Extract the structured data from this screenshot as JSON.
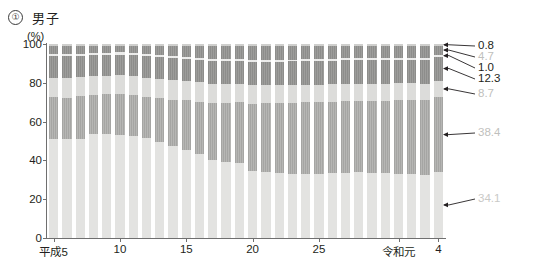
{
  "header": {
    "index_label": "①",
    "title": "男子"
  },
  "chart_data": {
    "type": "bar",
    "subtype": "stacked-100-percent",
    "title": "男子",
    "xlabel": "",
    "ylabel": "(%)",
    "ylim": [
      0,
      100
    ],
    "yticks": [
      0,
      20,
      40,
      60,
      80,
      100
    ],
    "grid": false,
    "legend_position": "none",
    "axis_unit": "(%)",
    "x_tick_labels": [
      "平成5",
      "10",
      "15",
      "20",
      "25",
      "令和元",
      "4"
    ],
    "x_tick_indices": [
      0,
      5,
      10,
      15,
      20,
      26,
      29
    ],
    "categories": [
      "平成5",
      "平成6",
      "平成7",
      "平成8",
      "平成9",
      "平成10",
      "平成11",
      "平成12",
      "平成13",
      "平成14",
      "平成15",
      "平成16",
      "平成17",
      "平成18",
      "平成19",
      "平成20",
      "平成21",
      "平成22",
      "平成23",
      "平成24",
      "平成25",
      "平成26",
      "平成27",
      "平成28",
      "平成29",
      "平成30",
      "令和元",
      "令和2",
      "令和3",
      "令和4"
    ],
    "series": [
      {
        "name": "segment-1",
        "color": "#e3e3e1",
        "final_value": 34.1,
        "values": [
          50.9,
          51.0,
          51.2,
          53.6,
          53.6,
          53.3,
          52.8,
          51.3,
          49.5,
          47.3,
          45.6,
          43.2,
          40.1,
          39.4,
          38.6,
          34.5,
          34.0,
          33.5,
          33.1,
          33.0,
          33.2,
          33.4,
          33.7,
          34.0,
          33.6,
          33.3,
          33.0,
          32.8,
          32.6,
          34.1
        ]
      },
      {
        "name": "segment-2",
        "color": "#a5a5a3",
        "final_value": 38.4,
        "values": [
          21.6,
          21.4,
          21.8,
          20.1,
          20.4,
          20.8,
          20.8,
          21.5,
          22.6,
          24.0,
          25.3,
          27.1,
          29.6,
          30.2,
          31.4,
          34.8,
          35.4,
          36.1,
          36.6,
          36.9,
          36.8,
          36.8,
          36.7,
          36.5,
          37.0,
          37.5,
          37.9,
          38.1,
          38.3,
          38.4
        ]
      },
      {
        "name": "segment-3",
        "color": "#dcdcda",
        "final_value": 8.7,
        "values": [
          10.0,
          10.1,
          9.9,
          9.8,
          9.7,
          9.7,
          9.8,
          9.9,
          10.0,
          10.0,
          10.0,
          9.9,
          9.8,
          9.7,
          9.6,
          9.4,
          9.3,
          9.2,
          9.2,
          9.1,
          9.1,
          9.0,
          9.0,
          8.9,
          8.9,
          8.8,
          8.8,
          8.8,
          8.7,
          8.7
        ]
      },
      {
        "name": "segment-4",
        "color": "#8d8d8b",
        "final_value": 12.3,
        "values": [
          11.1,
          11.2,
          11.0,
          10.9,
          10.8,
          10.8,
          10.9,
          11.0,
          11.2,
          11.3,
          11.4,
          11.5,
          11.7,
          11.8,
          11.9,
          12.0,
          12.1,
          12.1,
          12.1,
          12.1,
          12.1,
          12.2,
          12.2,
          12.2,
          12.2,
          12.3,
          12.3,
          12.3,
          12.3,
          12.3
        ]
      },
      {
        "name": "segment-5",
        "color": "#ececeb",
        "final_value": 1.0,
        "values": [
          1.2,
          1.2,
          1.1,
          1.1,
          1.1,
          1.1,
          1.1,
          1.1,
          1.1,
          1.1,
          1.1,
          1.1,
          1.1,
          1.0,
          1.0,
          1.0,
          1.0,
          1.0,
          1.0,
          1.0,
          1.0,
          1.0,
          1.0,
          1.0,
          1.0,
          1.0,
          1.0,
          1.0,
          1.0,
          1.0
        ]
      },
      {
        "name": "segment-6",
        "color": "#8d8d8b",
        "final_value": 4.7,
        "values": [
          4.3,
          4.2,
          4.1,
          3.6,
          3.5,
          3.4,
          3.7,
          4.2,
          4.6,
          5.3,
          5.6,
          6.1,
          6.6,
          6.8,
          6.4,
          7.2,
          7.1,
          7.0,
          7.0,
          6.9,
          6.8,
          6.6,
          6.4,
          6.4,
          6.3,
          6.1,
          5.9,
          5.9,
          5.9,
          4.7
        ]
      },
      {
        "name": "segment-7",
        "color": "#cfcfcd",
        "final_value": 0.8,
        "values": [
          0.9,
          0.9,
          0.9,
          0.9,
          0.9,
          0.9,
          0.9,
          1.0,
          1.0,
          1.0,
          1.0,
          1.1,
          1.1,
          1.1,
          1.1,
          1.1,
          1.1,
          1.1,
          1.0,
          1.0,
          1.0,
          1.0,
          1.0,
          1.0,
          1.0,
          1.0,
          1.1,
          1.1,
          1.2,
          0.8
        ]
      }
    ],
    "callouts": [
      {
        "label": "0.8",
        "series": "segment-7",
        "style": "dark"
      },
      {
        "label": "4.7",
        "series": "segment-6",
        "style": "gray"
      },
      {
        "label": "1.0",
        "series": "segment-5",
        "style": "dark"
      },
      {
        "label": "12.3",
        "series": "segment-4",
        "style": "dark"
      },
      {
        "label": "8.7",
        "series": "segment-3",
        "style": "gray"
      },
      {
        "label": "38.4",
        "series": "segment-2",
        "style": "gray"
      },
      {
        "label": "34.1",
        "series": "segment-1",
        "style": "gray2"
      }
    ]
  }
}
